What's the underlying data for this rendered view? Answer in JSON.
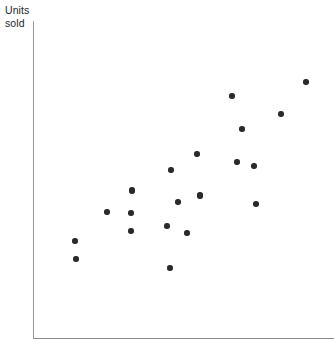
{
  "chart_data": {
    "type": "scatter",
    "title": "",
    "subtitle": "",
    "xlabel": "",
    "ylabel": "Units sold",
    "ylabel_lines": [
      "Units",
      "sold"
    ],
    "grid": false,
    "legend": false,
    "legend_position": "none",
    "x_tick_labels": [],
    "y_tick_labels": [],
    "xlim": [
      0,
      100
    ],
    "ylim": [
      0,
      100
    ],
    "marker": {
      "shape": "circle",
      "color": "#2a2a2a",
      "size_px": 5.4
    },
    "axis_color": "#8c8c8c",
    "background_color": "#ffffff",
    "n_points": 22,
    "relationship": "positive",
    "points": [
      {
        "x": 14.0,
        "y": 30.6
      },
      {
        "x": 14.3,
        "y": 24.9
      },
      {
        "x": 24.6,
        "y": 39.4
      },
      {
        "x": 32.9,
        "y": 46.4
      },
      {
        "x": 32.6,
        "y": 39.1
      },
      {
        "x": 32.6,
        "y": 33.8
      },
      {
        "x": 44.5,
        "y": 35.3
      },
      {
        "x": 44.5,
        "y": 22.4
      },
      {
        "x": 51.2,
        "y": 33.1
      },
      {
        "x": 48.2,
        "y": 42.9
      },
      {
        "x": 55.5,
        "y": 51.4
      },
      {
        "x": 54.5,
        "y": 44.8
      },
      {
        "x": 65.8,
        "y": 47.6
      },
      {
        "x": 67.8,
        "y": 55.5
      },
      {
        "x": 73.4,
        "y": 54.3
      },
      {
        "x": 74.1,
        "y": 42.3
      },
      {
        "x": 66.1,
        "y": 65.9
      },
      {
        "x": 69.4,
        "y": 76.3
      },
      {
        "x": 82.4,
        "y": 70.7
      },
      {
        "x": 83.1,
        "y": 60.9
      },
      {
        "x": 90.7,
        "y": 80.4
      },
      {
        "x": 33.0,
        "y": 46.5
      }
    ],
    "points_px": [
      {
        "px": 75,
        "py": 241
      },
      {
        "px": 76,
        "py": 259
      },
      {
        "px": 107,
        "py": 212
      },
      {
        "px": 132,
        "py": 191
      },
      {
        "px": 131,
        "py": 213
      },
      {
        "px": 131,
        "py": 231
      },
      {
        "px": 167,
        "py": 226
      },
      {
        "px": 170,
        "py": 268
      },
      {
        "px": 187,
        "py": 233
      },
      {
        "px": 178,
        "py": 202
      },
      {
        "px": 200,
        "py": 195
      },
      {
        "px": 197,
        "py": 154
      },
      {
        "px": 232,
        "py": 96
      },
      {
        "px": 237,
        "py": 162
      },
      {
        "px": 254,
        "py": 166
      },
      {
        "px": 256,
        "py": 204
      },
      {
        "px": 242,
        "py": 129
      },
      {
        "px": 281,
        "py": 114
      },
      {
        "px": 306,
        "py": 82
      },
      {
        "px": 171,
        "py": 170
      },
      {
        "px": 132,
        "py": 190
      },
      {
        "px": 200,
        "py": 196
      }
    ]
  }
}
